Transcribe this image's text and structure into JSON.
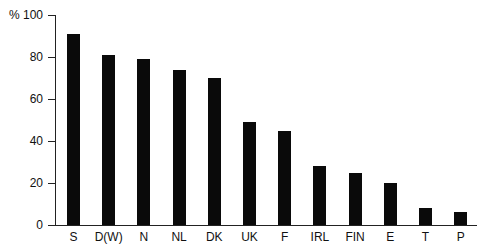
{
  "chart_data": {
    "type": "bar",
    "title": "",
    "xlabel": "",
    "ylabel": "%",
    "ylim": [
      0,
      100
    ],
    "yticks": [
      0,
      20,
      40,
      60,
      80,
      100
    ],
    "ytick_labels": [
      "0",
      "20",
      "40",
      "60",
      "80",
      "% 100"
    ],
    "grid": false,
    "legend": null,
    "bar_color": "#0a0a0a",
    "categories": [
      "S",
      "D(W)",
      "N",
      "NL",
      "DK",
      "UK",
      "F",
      "IRL",
      "FIN",
      "E",
      "T",
      "P"
    ],
    "values": [
      91,
      81,
      79,
      74,
      70,
      49,
      45,
      28,
      25,
      20,
      8,
      6
    ]
  }
}
